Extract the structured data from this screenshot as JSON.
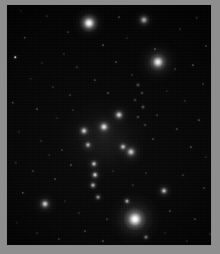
{
  "figure": {
    "kind": "astronomical-image",
    "width": 220,
    "height": 254,
    "background_color": "#010101",
    "margin_color": "#8e8e8e",
    "frame_color": "#8a8a8a",
    "object_color": "#ffffff",
    "colormap": "grayscale"
  },
  "chart_data": {
    "type": "scatter",
    "title": "",
    "xlabel": "",
    "ylabel": "",
    "grid": false,
    "legend": "none",
    "xlim": [
      0,
      206
    ],
    "ylim": [
      0,
      242
    ],
    "note": "Positions in image pixel coordinates within the framed field; size = apparent extent, brightness = peak surface brightness on a 0-1 scale",
    "galaxies": [
      {
        "id": "G1",
        "name": "bright-elliptical-top",
        "x": 82,
        "y": 18,
        "size": 20,
        "halo": 36,
        "brightness": 0.95,
        "morphology": "elliptical"
      },
      {
        "id": "G2",
        "name": "irregular-top-right",
        "x": 137,
        "y": 15,
        "size": 13,
        "halo": 26,
        "brightness": 0.55,
        "morphology": "irregular"
      },
      {
        "id": "G3",
        "name": "elliptical-right-upper",
        "x": 151,
        "y": 57,
        "size": 19,
        "halo": 46,
        "brightness": 0.88,
        "morphology": "elliptical"
      },
      {
        "id": "G4",
        "name": "group-member-north",
        "x": 112,
        "y": 110,
        "size": 12,
        "halo": 24,
        "brightness": 0.72,
        "morphology": "elliptical"
      },
      {
        "id": "G5",
        "name": "group-member-center",
        "x": 97,
        "y": 122,
        "size": 13,
        "halo": 26,
        "brightness": 0.8,
        "morphology": "elliptical"
      },
      {
        "id": "G6",
        "name": "group-member-west",
        "x": 77,
        "y": 126,
        "size": 11,
        "halo": 22,
        "brightness": 0.7,
        "morphology": "elliptical"
      },
      {
        "id": "G7",
        "name": "group-member-southwest",
        "x": 81,
        "y": 140,
        "size": 9,
        "halo": 18,
        "brightness": 0.6,
        "morphology": "compact"
      },
      {
        "id": "G8",
        "name": "group-member-southeast",
        "x": 116,
        "y": 142,
        "size": 10,
        "halo": 20,
        "brightness": 0.62,
        "morphology": "compact"
      },
      {
        "id": "G9",
        "name": "chain-member-upper",
        "x": 87,
        "y": 159,
        "size": 9,
        "halo": 18,
        "brightness": 0.66,
        "morphology": "compact"
      },
      {
        "id": "G10",
        "name": "chain-member-middle",
        "x": 88,
        "y": 170,
        "size": 9,
        "halo": 18,
        "brightness": 0.74,
        "morphology": "compact"
      },
      {
        "id": "G11",
        "name": "chain-member-lower",
        "x": 86,
        "y": 180,
        "size": 8,
        "halo": 16,
        "brightness": 0.58,
        "morphology": "compact"
      },
      {
        "id": "G12",
        "name": "chain-member-tail",
        "x": 91,
        "y": 192,
        "size": 7,
        "halo": 14,
        "brightness": 0.48,
        "morphology": "compact"
      },
      {
        "id": "G13",
        "name": "elliptical-right-lower",
        "x": 124,
        "y": 147,
        "size": 13,
        "halo": 28,
        "brightness": 0.7,
        "morphology": "elliptical"
      },
      {
        "id": "G14",
        "name": "compact-galaxy-right",
        "x": 157,
        "y": 186,
        "size": 10,
        "halo": 22,
        "brightness": 0.66,
        "morphology": "compact"
      },
      {
        "id": "G15",
        "name": "galaxy-lower-left",
        "x": 38,
        "y": 199,
        "size": 12,
        "halo": 26,
        "brightness": 0.72,
        "morphology": "elliptical"
      },
      {
        "id": "G16",
        "name": "brightest-cluster-galaxy",
        "x": 128,
        "y": 214,
        "size": 24,
        "halo": 58,
        "brightness": 1.0,
        "morphology": "elliptical"
      },
      {
        "id": "G17",
        "name": "companion-above-bcg",
        "x": 120,
        "y": 196,
        "size": 7,
        "halo": 14,
        "brightness": 0.55,
        "morphology": "compact"
      },
      {
        "id": "G18",
        "name": "companion-below-bcg",
        "x": 139,
        "y": 232,
        "size": 6,
        "halo": 13,
        "brightness": 0.42,
        "morphology": "compact"
      }
    ],
    "filament_knots": [
      {
        "x": 131,
        "y": 80,
        "size": 6,
        "brightness": 0.3
      },
      {
        "x": 135,
        "y": 88,
        "size": 5,
        "brightness": 0.26
      },
      {
        "x": 128,
        "y": 95,
        "size": 5,
        "brightness": 0.24
      },
      {
        "x": 136,
        "y": 102,
        "size": 6,
        "brightness": 0.32
      },
      {
        "x": 131,
        "y": 112,
        "size": 5,
        "brightness": 0.25
      },
      {
        "x": 138,
        "y": 120,
        "size": 5,
        "brightness": 0.22
      },
      {
        "x": 125,
        "y": 70,
        "size": 4,
        "brightness": 0.18
      }
    ],
    "common_envelope": {
      "name": "intragroup-light",
      "x": 97,
      "y": 133,
      "width": 86,
      "height": 78,
      "brightness": 0.28
    },
    "stars": [
      {
        "x": 14,
        "y": 6,
        "s": 1.2
      },
      {
        "x": 40,
        "y": 11,
        "s": 1.0
      },
      {
        "x": 61,
        "y": 27,
        "s": 1.1
      },
      {
        "x": 18,
        "y": 33,
        "s": 1.4
      },
      {
        "x": 96,
        "y": 40,
        "s": 1.0
      },
      {
        "x": 120,
        "y": 33,
        "s": 1.2
      },
      {
        "x": 173,
        "y": 24,
        "s": 1.1
      },
      {
        "x": 190,
        "y": 13,
        "s": 1.3
      },
      {
        "x": 199,
        "y": 41,
        "s": 1.0
      },
      {
        "x": 8,
        "y": 52,
        "s": 1.5
      },
      {
        "x": 35,
        "y": 58,
        "s": 1.0
      },
      {
        "x": 57,
        "y": 49,
        "s": 1.1
      },
      {
        "x": 70,
        "y": 62,
        "s": 1.2
      },
      {
        "x": 109,
        "y": 57,
        "s": 1.0
      },
      {
        "x": 186,
        "y": 60,
        "s": 1.1
      },
      {
        "x": 24,
        "y": 74,
        "s": 1.3
      },
      {
        "x": 46,
        "y": 82,
        "s": 1.0
      },
      {
        "x": 63,
        "y": 90,
        "s": 1.1
      },
      {
        "x": 88,
        "y": 75,
        "s": 1.2
      },
      {
        "x": 101,
        "y": 88,
        "s": 1.0
      },
      {
        "x": 160,
        "y": 86,
        "s": 1.1
      },
      {
        "x": 178,
        "y": 96,
        "s": 1.2
      },
      {
        "x": 196,
        "y": 79,
        "s": 1.0
      },
      {
        "x": 6,
        "y": 98,
        "s": 1.4
      },
      {
        "x": 30,
        "y": 104,
        "s": 1.1
      },
      {
        "x": 50,
        "y": 113,
        "s": 1.0
      },
      {
        "x": 66,
        "y": 105,
        "s": 1.2
      },
      {
        "x": 150,
        "y": 110,
        "s": 1.0
      },
      {
        "x": 170,
        "y": 124,
        "s": 1.1
      },
      {
        "x": 192,
        "y": 115,
        "s": 1.2
      },
      {
        "x": 12,
        "y": 127,
        "s": 1.3
      },
      {
        "x": 34,
        "y": 136,
        "s": 1.0
      },
      {
        "x": 55,
        "y": 145,
        "s": 1.1
      },
      {
        "x": 146,
        "y": 134,
        "s": 1.0
      },
      {
        "x": 184,
        "y": 142,
        "s": 1.2
      },
      {
        "x": 199,
        "y": 152,
        "s": 1.0
      },
      {
        "x": 9,
        "y": 158,
        "s": 1.4
      },
      {
        "x": 26,
        "y": 166,
        "s": 1.1
      },
      {
        "x": 48,
        "y": 174,
        "s": 1.0
      },
      {
        "x": 64,
        "y": 160,
        "s": 1.1
      },
      {
        "x": 106,
        "y": 166,
        "s": 1.0
      },
      {
        "x": 139,
        "y": 168,
        "s": 1.1
      },
      {
        "x": 176,
        "y": 170,
        "s": 1.2
      },
      {
        "x": 197,
        "y": 183,
        "s": 1.0
      },
      {
        "x": 16,
        "y": 188,
        "s": 1.3
      },
      {
        "x": 58,
        "y": 196,
        "s": 1.0
      },
      {
        "x": 72,
        "y": 208,
        "s": 1.1
      },
      {
        "x": 100,
        "y": 214,
        "s": 1.0
      },
      {
        "x": 163,
        "y": 206,
        "s": 1.1
      },
      {
        "x": 188,
        "y": 214,
        "s": 1.2
      },
      {
        "x": 10,
        "y": 218,
        "s": 1.4
      },
      {
        "x": 30,
        "y": 228,
        "s": 1.0
      },
      {
        "x": 52,
        "y": 234,
        "s": 1.1
      },
      {
        "x": 78,
        "y": 226,
        "s": 1.0
      },
      {
        "x": 96,
        "y": 236,
        "s": 1.1
      },
      {
        "x": 158,
        "y": 228,
        "s": 1.0
      },
      {
        "x": 180,
        "y": 236,
        "s": 1.2
      },
      {
        "x": 203,
        "y": 229,
        "s": 1.0
      },
      {
        "x": 112,
        "y": 12,
        "s": 1.0
      },
      {
        "x": 148,
        "y": 44,
        "s": 1.0
      },
      {
        "x": 42,
        "y": 150,
        "s": 1.0
      },
      {
        "x": 126,
        "y": 180,
        "s": 1.0
      },
      {
        "x": 168,
        "y": 64,
        "s": 1.0
      }
    ]
  }
}
